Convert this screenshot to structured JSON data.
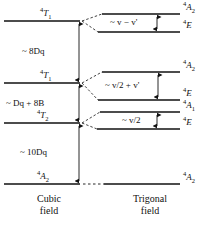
{
  "figure": {
    "type": "energy-level-splitting-diagram",
    "columns": [
      {
        "id": "cubic",
        "caption": "Cubic\nfield"
      },
      {
        "id": "trigonal",
        "caption": "Trigonal\nfield"
      }
    ]
  },
  "cubic_levels": [
    {
      "id": "cubic-t1-upper",
      "label_sup": "4",
      "label_term": "T",
      "label_sub": "1",
      "y": 21
    },
    {
      "id": "cubic-t1-lower",
      "label_sup": "4",
      "label_term": "T",
      "label_sub": "1",
      "y": 83
    },
    {
      "id": "cubic-t2",
      "label_sup": "4",
      "label_term": "T",
      "label_sub": "2",
      "y": 123
    },
    {
      "id": "cubic-a2-ground",
      "label_sup": "4",
      "label_term": "A",
      "label_sub": "2",
      "y": 184
    }
  ],
  "trigonal_levels": [
    {
      "id": "trig-a2-top",
      "label_sup": "4",
      "label_term": "A",
      "label_sub": "2",
      "y": 14
    },
    {
      "id": "trig-e-top",
      "label_sup": "4",
      "label_term": "E",
      "label_sub": "",
      "y": 32
    },
    {
      "id": "trig-a2-mid",
      "label_sup": "4",
      "label_term": "A",
      "label_sub": "2",
      "y": 72
    },
    {
      "id": "trig-e-mid",
      "label_sup": "4",
      "label_term": "E",
      "label_sub": "",
      "y": 100
    },
    {
      "id": "trig-a1",
      "label_sup": "4",
      "label_term": "A",
      "label_sub": "1",
      "y": 112
    },
    {
      "id": "trig-e-low",
      "label_sup": "4",
      "label_term": "E",
      "label_sub": "",
      "y": 129
    },
    {
      "id": "trig-a2-ground",
      "label_sup": "4",
      "label_term": "A",
      "label_sub": "2",
      "y": 184
    }
  ],
  "cubic_gaps": [
    {
      "id": "gap-8dq",
      "text": "~ 8Dq",
      "from_y": 21,
      "to_y": 83
    },
    {
      "id": "gap-dq-8b",
      "text": "~ Dq + 8B",
      "from_y": 83,
      "to_y": 123
    },
    {
      "id": "gap-10dq",
      "text": "~ 10Dq",
      "from_y": 123,
      "to_y": 184
    }
  ],
  "trigonal_splittings": [
    {
      "id": "split-nu-minus-nuprime",
      "text": "~ v − v'",
      "from_y": 14,
      "to_y": 32
    },
    {
      "id": "split-nu-half-plus-nuprime",
      "text": "~ v/2 + v'",
      "from_y": 72,
      "to_y": 100
    },
    {
      "id": "split-nu-half",
      "text": "~ v/2",
      "from_y": 112,
      "to_y": 129
    }
  ],
  "colors": {
    "ink": "#111111",
    "background": "#ffffff"
  }
}
